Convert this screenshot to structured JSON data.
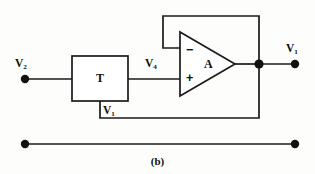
{
  "figure": {
    "caption": "(b)",
    "background_color": "#fdfdfb",
    "line_color": "#1a1a1a"
  },
  "labels": {
    "input_v2": {
      "text": "V",
      "sub": "2"
    },
    "mid_v4": {
      "text": "V",
      "sub": "4"
    },
    "feedback_v1": {
      "text": "V",
      "sub": "1"
    },
    "output_v1": {
      "text": "V",
      "sub": "1"
    },
    "block_t": "T",
    "amp_gain": "A",
    "amp_inverting": "−",
    "amp_noninverting": "+"
  },
  "nodes": {
    "input_terminal": {
      "x": 25,
      "y": 79
    },
    "output_junction": {
      "x": 259,
      "y": 64
    },
    "output_terminal": {
      "x": 295,
      "y": 64
    },
    "ground_left_terminal": {
      "x": 25,
      "y": 144
    },
    "ground_right_terminal": {
      "x": 295,
      "y": 144
    }
  },
  "shapes": {
    "block_t_rect": {
      "x": 72,
      "y": 56,
      "width": 56,
      "height": 45
    },
    "opamp_triangle": {
      "left": 180,
      "top": 32,
      "bottom": 96,
      "apex_x": 235,
      "apex_y": 64
    }
  }
}
